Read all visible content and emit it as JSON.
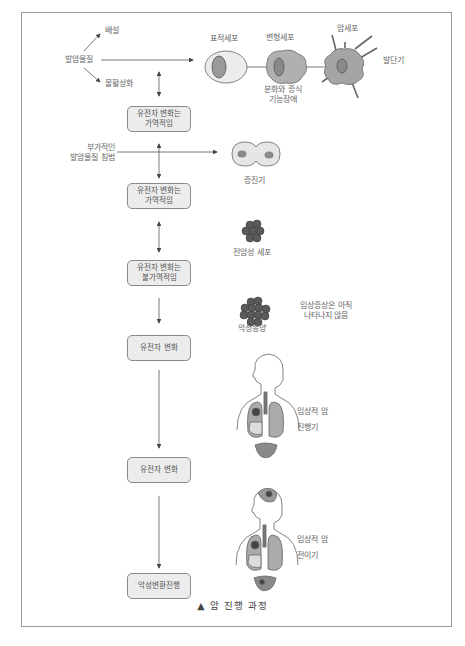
{
  "figure": {
    "caption_marker": "▲",
    "caption": "암 진행 과정"
  },
  "carcinogen": {
    "label": "발암물질",
    "excretion": "배설",
    "inactivation": "불활성화",
    "additional_line1": "부가적인",
    "additional_line2": "발암물질 침범"
  },
  "stages": [
    {
      "line1": "유전자 변화는",
      "line2": "가역적임"
    },
    {
      "line1": "유전자 변화는",
      "line2": "가역적임"
    },
    {
      "line1": "유전자 변화는",
      "line2": "불가역적임"
    },
    {
      "line1": "유전자 변화",
      "line2": ""
    },
    {
      "line1": "유전자 변화",
      "line2": ""
    },
    {
      "line1": "악성변환진행",
      "line2": ""
    }
  ],
  "cells": {
    "target_cell": "표적세포",
    "transformed_cell": "변형세포",
    "cancer_cell": "암세포",
    "initiation": "발단기",
    "dysfunction_line1": "분화와 증식",
    "dysfunction_line2": "기능장애",
    "promotion": "증진기",
    "precancerous": "전암성 세포",
    "malignant_tumor": "악성종양",
    "no_symptoms_line1": "임상증상은 아직",
    "no_symptoms_line2": "나타나지 않음"
  },
  "body_stages": {
    "progression_line1": "임상적 암",
    "progression_line2": "진행기",
    "metastasis_line1": "임상적 암",
    "metastasis_line2": "전이기"
  },
  "colors": {
    "frame": "#9a9a9a",
    "box_fill": "#ececec",
    "cell_light": "#e6e6e6",
    "cell_mid": "#a8a8a8",
    "nucleus": "#8a8a8a",
    "tumor": "#555555",
    "organ": "#999999"
  }
}
